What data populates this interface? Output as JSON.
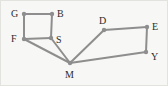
{
  "figure": {
    "kind": "undirected-graph-diagram",
    "width": 168,
    "height": 86,
    "background_color": "#f7f7f5",
    "edge_color": "#8e8e8e",
    "node_color": "#8e8e8e",
    "label_color": "#2b2b2b"
  },
  "graph": {
    "nodes": [
      {
        "id": "G",
        "label": "G",
        "cx": 24,
        "cy": 14,
        "r": 2.2,
        "label_x": 11,
        "label_y": 9
      },
      {
        "id": "B",
        "label": "B",
        "cx": 52,
        "cy": 14,
        "r": 2.2,
        "label_x": 57,
        "label_y": 9
      },
      {
        "id": "F",
        "label": "F",
        "cx": 24,
        "cy": 39,
        "r": 2.2,
        "label_x": 11,
        "label_y": 34
      },
      {
        "id": "S",
        "label": "S",
        "cx": 51,
        "cy": 38,
        "r": 2.2,
        "label_x": 56,
        "label_y": 35
      },
      {
        "id": "D",
        "label": "D",
        "cx": 104,
        "cy": 30,
        "r": 2.2,
        "label_x": 99,
        "label_y": 16
      },
      {
        "id": "E",
        "label": "E",
        "cx": 147,
        "cy": 27,
        "r": 2.2,
        "label_x": 152,
        "label_y": 22
      },
      {
        "id": "Y",
        "label": "Y",
        "cx": 146,
        "cy": 52,
        "r": 2.2,
        "label_x": 151,
        "label_y": 52
      },
      {
        "id": "M",
        "label": "M",
        "cx": 70,
        "cy": 63,
        "r": 2.2,
        "label_x": 65,
        "label_y": 70
      }
    ],
    "edges": [
      {
        "from": "G",
        "to": "B"
      },
      {
        "from": "G",
        "to": "F"
      },
      {
        "from": "B",
        "to": "S"
      },
      {
        "from": "F",
        "to": "S"
      },
      {
        "from": "F",
        "to": "M"
      },
      {
        "from": "S",
        "to": "M"
      },
      {
        "from": "M",
        "to": "D"
      },
      {
        "from": "D",
        "to": "E"
      },
      {
        "from": "E",
        "to": "Y"
      },
      {
        "from": "Y",
        "to": "M"
      }
    ]
  }
}
